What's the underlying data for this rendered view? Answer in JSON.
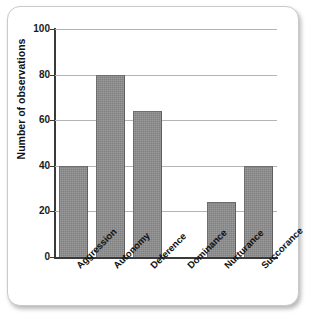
{
  "chart_data": {
    "type": "bar",
    "title": "",
    "xlabel": "",
    "ylabel": "Number of observations",
    "categories": [
      "Aggression",
      "Autonomy",
      "Deference",
      "Dominance",
      "Nurturance",
      "Succorance"
    ],
    "values": [
      40,
      80,
      64,
      0,
      24,
      40
    ],
    "ylim": [
      0,
      100
    ],
    "yticks": [
      0,
      20,
      40,
      60,
      80,
      100
    ],
    "ytick_labels": [
      "0",
      "20",
      "40",
      "60",
      "80",
      "100"
    ],
    "grid": true,
    "legend": false,
    "bar_color": "#808080",
    "gridline_color": "#b4b4b4",
    "axis_color": "#3a3a3a"
  }
}
